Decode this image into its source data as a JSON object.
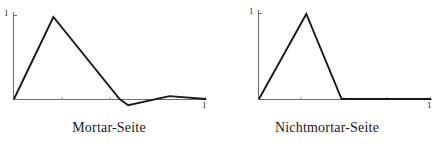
{
  "figure": {
    "background_color": "#ffffff",
    "line_color": "#1a1a1a",
    "axis_color": "#6e6e6e",
    "panels": [
      {
        "caption": "Mortar-Seite",
        "y_axis_label": "1",
        "x_axis_label": "1"
      },
      {
        "caption": "Nichtmortar-Seite",
        "y_axis_label": "1",
        "x_axis_label": "1"
      }
    ]
  },
  "chart_data": [
    {
      "type": "line",
      "title": "Mortar-Seite",
      "xlabel": "",
      "ylabel": "",
      "xlim": [
        0,
        1
      ],
      "ylim": [
        -0.08,
        1.05
      ],
      "grid": false,
      "legend": "none",
      "x_tick_labels": [
        "1"
      ],
      "x_tick_values": [
        1
      ],
      "y_tick_labels": [
        "1"
      ],
      "y_tick_values": [
        1
      ],
      "series": [
        {
          "name": "Mortar-Seite",
          "x": [
            0.0,
            0.205,
            0.55,
            0.595,
            0.81,
            1.0
          ],
          "y": [
            0.0,
            1.0,
            0.0,
            -0.075,
            0.035,
            0.0
          ]
        }
      ]
    },
    {
      "type": "line",
      "title": "Nichtmortar-Seite",
      "xlabel": "",
      "ylabel": "",
      "xlim": [
        0,
        1
      ],
      "ylim": [
        -0.08,
        1.05
      ],
      "grid": false,
      "legend": "none",
      "x_tick_labels": [
        "1"
      ],
      "x_tick_values": [
        1
      ],
      "y_tick_labels": [
        "1"
      ],
      "y_tick_values": [
        1
      ],
      "series": [
        {
          "name": "Nichtmortar-Seite",
          "x": [
            0.0,
            0.275,
            0.48,
            1.0
          ],
          "y": [
            0.0,
            1.0,
            0.0,
            0.0
          ]
        }
      ]
    }
  ]
}
